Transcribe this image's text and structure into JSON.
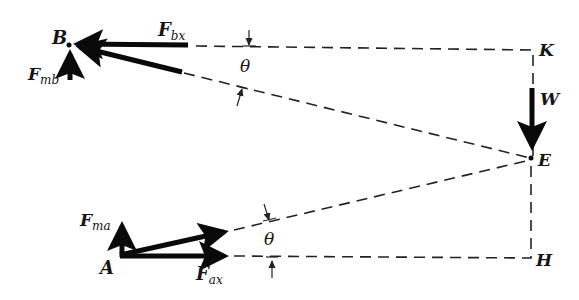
{
  "figure": {
    "type": "free-body / geometry diagram",
    "points": {
      "B": {
        "label": "B"
      },
      "K": {
        "label": "K"
      },
      "E": {
        "label": "E"
      },
      "A": {
        "label": "A"
      },
      "H": {
        "label": "H"
      }
    },
    "forces": {
      "F_bx": {
        "main": "F",
        "sub": "bx"
      },
      "F_mb": {
        "main": "F",
        "sub": "mb"
      },
      "W": {
        "main": "W",
        "sub": ""
      },
      "F_ma": {
        "main": "F",
        "sub": "ma"
      },
      "F_ax": {
        "main": "F",
        "sub": "ax"
      }
    },
    "angles": {
      "upper": "θ",
      "lower": "θ"
    },
    "colors": {
      "ink": "#0a0a0a",
      "background": "#ffffff"
    }
  }
}
